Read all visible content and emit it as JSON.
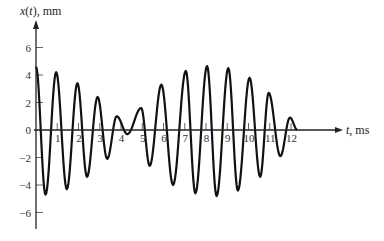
{
  "chart_data": {
    "type": "line",
    "title": "",
    "xlabel": "t, ms",
    "ylabel_parts": {
      "var": "x",
      "arg": "t",
      "units": "mm"
    },
    "ylabel": "x(t), mm",
    "xlim": [
      0,
      14
    ],
    "ylim": [
      -7,
      7.5
    ],
    "x_ticks": [
      1,
      2,
      3,
      4,
      5,
      6,
      7,
      8,
      9,
      10,
      11,
      12
    ],
    "x_tick_labels": [
      "1",
      "2",
      "3",
      "4",
      "5",
      "6",
      "7",
      "8",
      "9",
      "10",
      "11",
      "12"
    ],
    "y_ticks": [
      6,
      4,
      2,
      0,
      -2,
      -4,
      -6
    ],
    "y_tick_labels": [
      "6",
      "4",
      "2",
      "0",
      "−2",
      "−4",
      "−6"
    ],
    "grid": false,
    "legend": "none",
    "series": [
      {
        "name": "x(t)",
        "description": "beating oscillation; extrema points (t in ms, x in mm)",
        "extrema": [
          [
            0.0,
            4.6
          ],
          [
            0.45,
            -4.7
          ],
          [
            0.95,
            4.2
          ],
          [
            1.45,
            -4.3
          ],
          [
            1.95,
            3.4
          ],
          [
            2.4,
            -3.4
          ],
          [
            2.9,
            2.4
          ],
          [
            3.35,
            -2.1
          ],
          [
            3.8,
            1.0
          ],
          [
            4.3,
            -0.3
          ],
          [
            4.95,
            1.6
          ],
          [
            5.35,
            -2.6
          ],
          [
            5.9,
            3.3
          ],
          [
            6.45,
            -4.0
          ],
          [
            7.05,
            4.3
          ],
          [
            7.5,
            -4.6
          ],
          [
            8.05,
            4.65
          ],
          [
            8.5,
            -4.8
          ],
          [
            9.05,
            4.5
          ],
          [
            9.5,
            -4.4
          ],
          [
            10.05,
            3.8
          ],
          [
            10.55,
            -3.4
          ],
          [
            10.95,
            2.7
          ],
          [
            11.5,
            -1.9
          ],
          [
            11.95,
            0.9
          ],
          [
            12.3,
            0.0
          ]
        ]
      }
    ]
  }
}
